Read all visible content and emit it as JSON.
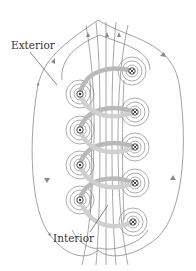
{
  "figure": {
    "labels": {
      "exterior": "Exterior",
      "interior": "Interior"
    },
    "colors": {
      "field_line": "#8a8a8a",
      "coil": "#b9b9b9",
      "wire": "#333333",
      "text": "#333333"
    },
    "wires_left_out_of_page": [
      {
        "x": 80,
        "y": 94
      },
      {
        "x": 80,
        "y": 130
      },
      {
        "x": 80,
        "y": 165
      },
      {
        "x": 80,
        "y": 200
      }
    ],
    "wires_right_into_page": [
      {
        "x": 132,
        "y": 71
      },
      {
        "x": 135,
        "y": 112
      },
      {
        "x": 135,
        "y": 147
      },
      {
        "x": 135,
        "y": 183
      },
      {
        "x": 133,
        "y": 222
      }
    ]
  }
}
